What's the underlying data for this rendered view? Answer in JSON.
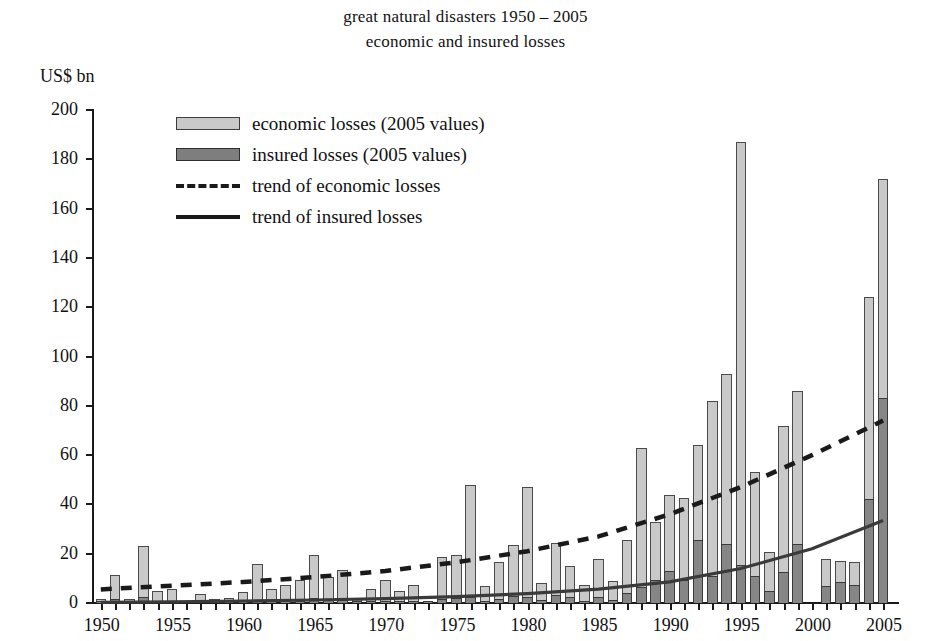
{
  "title": {
    "line1": "great natural disasters 1950 – 2005",
    "line2": "economic and insured losses"
  },
  "axis_unit_label": "US$ bn",
  "legend": {
    "items": [
      {
        "label": "economic losses (2005 values)",
        "marker": "filled-box-light",
        "color": "#c9c9c9"
      },
      {
        "label": "insured losses (2005 values)",
        "marker": "filled-box-dark",
        "color": "#7e7e7e"
      },
      {
        "label": "trend of economic losses",
        "marker": "dashed-line",
        "color": "#1a1a1a"
      },
      {
        "label": "trend of insured losses",
        "marker": "solid-line",
        "color": "#1a1a1a"
      }
    ]
  },
  "chart_data": {
    "type": "bar",
    "xlabel": "",
    "ylabel": "US$ bn",
    "ylim": [
      0,
      200
    ],
    "ytick_step": 20,
    "yticks": [
      0,
      20,
      40,
      60,
      80,
      100,
      120,
      140,
      160,
      180,
      200
    ],
    "xlim": [
      1950,
      2005
    ],
    "xticks_labeled": [
      1950,
      1955,
      1960,
      1965,
      1970,
      1975,
      1980,
      1985,
      1990,
      1995,
      2000,
      2005
    ],
    "grid": false,
    "legend_position": "upper-left-inside",
    "stacked": "insured losses drawn inside the economic losses bar (subset)",
    "categories": [
      1950,
      1951,
      1952,
      1953,
      1954,
      1955,
      1956,
      1957,
      1958,
      1959,
      1960,
      1961,
      1962,
      1963,
      1964,
      1965,
      1966,
      1967,
      1968,
      1969,
      1970,
      1971,
      1972,
      1973,
      1974,
      1975,
      1976,
      1977,
      1978,
      1979,
      1980,
      1981,
      1982,
      1983,
      1984,
      1985,
      1986,
      1987,
      1988,
      1989,
      1990,
      1991,
      1992,
      1993,
      1994,
      1995,
      1996,
      1997,
      1998,
      1999,
      2000,
      2001,
      2002,
      2003,
      2004,
      2005
    ],
    "series": [
      {
        "name": "economic losses (2005 values)",
        "color": "#c9c9c9",
        "values": [
          1.5,
          11.5,
          1.5,
          23.0,
          5.0,
          5.5,
          1.0,
          3.5,
          1.5,
          2.0,
          4.5,
          16.0,
          5.5,
          7.5,
          9.5,
          19.5,
          10.5,
          13.5,
          1.5,
          5.5,
          9.5,
          5.0,
          7.5,
          1.0,
          18.5,
          19.5,
          48.0,
          7.0,
          16.5,
          23.5,
          47.0,
          8.0,
          24.5,
          15.0,
          7.5,
          18.0,
          9.0,
          25.5,
          63.0,
          33.0,
          44.0,
          42.5,
          64.0,
          82.0,
          93.0,
          187.0,
          53.0,
          20.5,
          72.0,
          86.0,
          0.0,
          18.0,
          17.0,
          16.5,
          124.0,
          172.0
        ]
      },
      {
        "name": "insured losses (2005 values)",
        "color": "#868686",
        "values": [
          0.2,
          1.8,
          0.2,
          2.5,
          0.6,
          0.9,
          0.1,
          0.4,
          0.2,
          0.3,
          0.6,
          1.2,
          1.1,
          0.7,
          1.0,
          2.2,
          1.1,
          1.4,
          0.2,
          0.6,
          1.0,
          0.6,
          1.0,
          0.2,
          1.8,
          2.0,
          2.6,
          0.8,
          1.8,
          2.8,
          2.6,
          1.2,
          3.2,
          2.6,
          1.0,
          2.4,
          1.2,
          4.0,
          6.5,
          9.5,
          13.0,
          9.5,
          25.5,
          11.0,
          24.0,
          15.5,
          11.0,
          5.0,
          12.5,
          24.0,
          0.0,
          7.0,
          8.5,
          7.5,
          42.0,
          83.0
        ]
      }
    ],
    "trend_lines": [
      {
        "name": "trend of economic losses",
        "style": "dashed",
        "color": "#1a1a1a",
        "start": {
          "x": 1950,
          "y": 5.5
        },
        "end": {
          "x": 2005,
          "y": 74.0
        },
        "points": [
          [
            1950,
            5.5
          ],
          [
            1955,
            7.0
          ],
          [
            1960,
            8.5
          ],
          [
            1965,
            10.5
          ],
          [
            1970,
            13.0
          ],
          [
            1975,
            16.5
          ],
          [
            1980,
            21.0
          ],
          [
            1985,
            27.0
          ],
          [
            1990,
            36.0
          ],
          [
            1995,
            47.0
          ],
          [
            2000,
            60.0
          ],
          [
            2005,
            74.0
          ]
        ]
      },
      {
        "name": "trend of insured losses",
        "style": "solid",
        "color": "#3a3a3a",
        "start": {
          "x": 1950,
          "y": 0.3
        },
        "end": {
          "x": 2005,
          "y": 33.5
        },
        "points": [
          [
            1950,
            0.3
          ],
          [
            1955,
            0.5
          ],
          [
            1960,
            0.8
          ],
          [
            1965,
            1.2
          ],
          [
            1970,
            1.8
          ],
          [
            1975,
            2.6
          ],
          [
            1980,
            3.8
          ],
          [
            1985,
            5.6
          ],
          [
            1990,
            8.6
          ],
          [
            1995,
            14.0
          ],
          [
            2000,
            22.0
          ],
          [
            2005,
            33.5
          ]
        ]
      }
    ]
  }
}
